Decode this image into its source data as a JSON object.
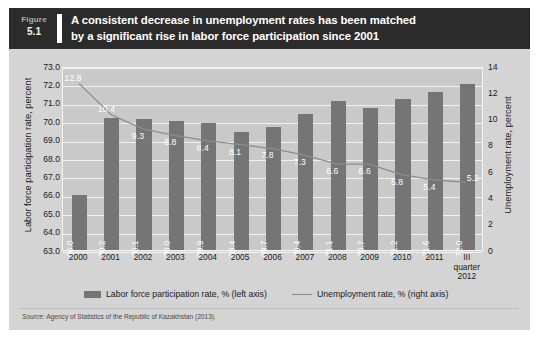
{
  "figure": {
    "label": "Figure",
    "number": "5.1",
    "title_line1": "A consistent decrease in unemployment rates has been matched",
    "title_line2": "by a significant rise in labor force participation since 2001",
    "source_prefix": "Source:",
    "source_text": "Agency of Statistics of the Republic of Kazakhstan (2013)."
  },
  "colors": {
    "header_bg": "#2b2b2b",
    "figure_bg": "#d4d4d4",
    "plot_bg": "#c9c9c9",
    "bar": "#757575",
    "line": "#8c8c8c",
    "gridline": "#f2f2f2",
    "label_text": "#ffffff"
  },
  "chart_data": {
    "type": "bar",
    "title": "A consistent decrease in unemployment rates has been matched by a significant rise in labor force participation since 2001",
    "categories": [
      "2000",
      "2001",
      "2002",
      "2003",
      "2004",
      "2005",
      "2006",
      "2007",
      "2008",
      "2009",
      "2010",
      "2011",
      "III quarter 2012"
    ],
    "category_lines": [
      [
        "2000"
      ],
      [
        "2001"
      ],
      [
        "2002"
      ],
      [
        "2003"
      ],
      [
        "2004"
      ],
      [
        "2005"
      ],
      [
        "2006"
      ],
      [
        "2007"
      ],
      [
        "2008"
      ],
      [
        "2009"
      ],
      [
        "2010"
      ],
      [
        "2011"
      ],
      [
        "III",
        "quarter",
        "2012"
      ]
    ],
    "series": [
      {
        "name": "Labor force participation rate, % (left axis)",
        "type": "bar",
        "axis": "left",
        "values": [
          66.0,
          70.2,
          70.1,
          70.0,
          69.9,
          69.4,
          69.7,
          70.4,
          71.1,
          70.7,
          71.2,
          71.6,
          72.0
        ],
        "labels": [
          "66.0",
          "70.2",
          "70.1",
          "70.0",
          "69.9",
          "69.4",
          "69.7",
          "70.4",
          "71.1",
          "70.7",
          "71.2",
          "71.6",
          "72.0"
        ]
      },
      {
        "name": "Unemployment rate, % (right axis)",
        "type": "line",
        "axis": "right",
        "values": [
          12.8,
          10.4,
          9.3,
          8.8,
          8.4,
          8.1,
          7.8,
          7.3,
          6.6,
          6.6,
          5.8,
          5.4,
          5.2
        ],
        "labels": [
          "12.8",
          "10.4",
          "9.3",
          "8.8",
          "8.4",
          "8.1",
          "7.8",
          "7.3",
          "6.6",
          "6.6",
          "5.8",
          "5.4",
          "5.2"
        ]
      }
    ],
    "xlabel": "",
    "ylabel_left": "Labor force participation rate, percent",
    "ylabel_right": "Unemployment rate, percent",
    "ylim_left": [
      63.0,
      73.0
    ],
    "ylim_right": [
      0,
      14
    ],
    "yticks_left": [
      "63.0",
      "64.0",
      "65.0",
      "66.0",
      "67.0",
      "68.0",
      "69.0",
      "70.0",
      "71.0",
      "72.0",
      "73.0"
    ],
    "yticks_right": [
      "0",
      "2",
      "4",
      "6",
      "8",
      "10",
      "12",
      "14"
    ],
    "grid": true,
    "legend_position": "bottom"
  },
  "legend": {
    "items": [
      {
        "label": "Labor force participation rate, % (left axis)",
        "marker": "bar-swatch"
      },
      {
        "label": "Unemployment rate, % (right axis)",
        "marker": "line-swatch"
      }
    ]
  }
}
